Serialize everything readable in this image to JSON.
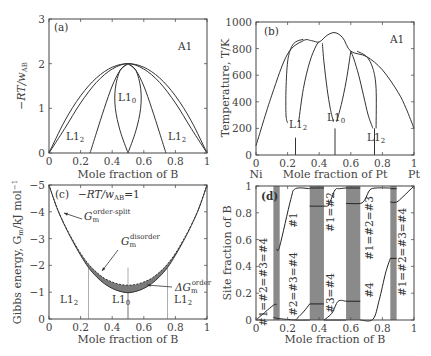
{
  "chart_data": [
    {
      "id": "a",
      "type": "line",
      "panel_label": "(a)",
      "title": "",
      "xlabel": "Mole fraction of B",
      "ylabel": "−RT/w_AB",
      "xlim": [
        0,
        1
      ],
      "ylim": [
        0,
        3
      ],
      "xticks": [
        "0",
        "0.2",
        "0.4",
        "0.6",
        "0.8",
        "1"
      ],
      "yticks": [
        "0",
        "1",
        "2",
        "3"
      ],
      "annotations": [
        "A1",
        "L1₀",
        "L1₂",
        "L1₂"
      ],
      "series": [
        {
          "name": "A1 boundary (outer)",
          "x": [
            0,
            0.1,
            0.2,
            0.3,
            0.4,
            0.5,
            0.6,
            0.7,
            0.8,
            0.9,
            1
          ],
          "y": [
            0,
            0.72,
            1.28,
            1.68,
            1.92,
            2.0,
            1.92,
            1.68,
            1.28,
            0.72,
            0
          ]
        },
        {
          "name": "A1/L1₂ boundary (inner)",
          "x": [
            0,
            0.1,
            0.2,
            0.3,
            0.4,
            0.5,
            0.6,
            0.7,
            0.8,
            0.9,
            1
          ],
          "y": [
            0,
            0.55,
            1.12,
            1.58,
            1.88,
            2.0,
            1.88,
            1.58,
            1.12,
            0.55,
            0
          ]
        },
        {
          "name": "L1₂/L1₀ boundary left",
          "x": [
            0.26,
            0.3,
            0.35,
            0.4,
            0.45,
            0.5
          ],
          "y": [
            0,
            0.45,
            1.0,
            1.5,
            1.85,
            2.0
          ]
        },
        {
          "name": "L1₂/L1₀ boundary right",
          "x": [
            0.5,
            0.55,
            0.6,
            0.65,
            0.7,
            0.74
          ],
          "y": [
            2.0,
            1.85,
            1.5,
            1.0,
            0.45,
            0
          ]
        },
        {
          "name": "L1₀ lens left",
          "x": [
            0.5,
            0.45,
            0.42,
            0.42,
            0.45,
            0.5
          ],
          "y": [
            0,
            0.5,
            1.0,
            1.45,
            1.85,
            2.0
          ]
        },
        {
          "name": "L1₀ lens right",
          "x": [
            0.5,
            0.55,
            0.58,
            0.58,
            0.55,
            0.5
          ],
          "y": [
            0,
            0.5,
            1.0,
            1.45,
            1.85,
            2.0
          ]
        }
      ]
    },
    {
      "id": "b",
      "type": "line",
      "panel_label": "(b)",
      "xlabel": "Mole fraction of Pt",
      "ylabel": "Temperature, T/K",
      "xlim": [
        0,
        1
      ],
      "ylim": [
        0,
        1000
      ],
      "xticks": [
        "0",
        "0.2",
        "0.4",
        "0.6",
        "0.8",
        "1"
      ],
      "yticks": [
        "0",
        "200",
        "400",
        "600",
        "800",
        "1000"
      ],
      "x_end_labels": [
        "Ni",
        "Pt"
      ],
      "annotations": [
        "A1",
        "L1₀",
        "L1₂",
        "L1₂"
      ],
      "series": [
        {
          "name": "A1 liquidus-like outer",
          "x": [
            0,
            0.1,
            0.2,
            0.3,
            0.35,
            0.4,
            0.45,
            0.5,
            0.55,
            0.6,
            0.7,
            0.8,
            0.9,
            0.95,
            1
          ],
          "y": [
            70,
            450,
            760,
            860,
            860,
            850,
            900,
            920,
            880,
            780,
            740,
            640,
            470,
            350,
            200
          ]
        },
        {
          "name": "L1₂ left dome left side",
          "x": [
            0.2,
            0.19,
            0.19,
            0.2,
            0.22,
            0.25,
            0.3
          ],
          "y": [
            240,
            300,
            500,
            700,
            800,
            850,
            870
          ]
        },
        {
          "name": "L1₂ left dome right side",
          "x": [
            0.27,
            0.3,
            0.34,
            0.38,
            0.4
          ],
          "y": [
            250,
            500,
            700,
            820,
            850
          ]
        },
        {
          "name": "L1₀ left side",
          "x": [
            0.42,
            0.43,
            0.45,
            0.47,
            0.49
          ],
          "y": [
            840,
            700,
            500,
            350,
            250
          ]
        },
        {
          "name": "L1₀ right side",
          "x": [
            0.51,
            0.54,
            0.57,
            0.59,
            0.6
          ],
          "y": [
            250,
            380,
            550,
            700,
            780
          ]
        },
        {
          "name": "L1₂ right dome left side",
          "x": [
            0.6,
            0.62,
            0.65,
            0.68,
            0.71,
            0.74
          ],
          "y": [
            780,
            720,
            600,
            450,
            300,
            200
          ]
        },
        {
          "name": "L1₂ right dome right side",
          "x": [
            0.64,
            0.7,
            0.74,
            0.76,
            0.76
          ],
          "y": [
            780,
            740,
            650,
            500,
            200
          ]
        },
        {
          "name": "L1₂ stem left",
          "x": [
            0.25,
            0.25
          ],
          "y": [
            0,
            130
          ]
        },
        {
          "name": "L1₀ stem",
          "x": [
            0.5,
            0.5
          ],
          "y": [
            0,
            200
          ]
        },
        {
          "name": "L1₂ stem right",
          "x": [
            0.75,
            0.75
          ],
          "y": [
            0,
            200
          ]
        }
      ]
    },
    {
      "id": "c",
      "type": "area",
      "panel_label": "(c)",
      "subtitle": "−RT/w_AB=1",
      "xlabel": "Mole fraction of B",
      "ylabel": "Gibbs energy, G_m/kJ mol⁻¹",
      "xlim": [
        0,
        1
      ],
      "ylim": [
        -5,
        0
      ],
      "xticks": [
        "0",
        "0.2",
        "0.4",
        "0.6",
        "0.8",
        "1"
      ],
      "yticks": [
        "0",
        "−1",
        "−2",
        "−3",
        "−4",
        "−5"
      ],
      "annotations": [
        "G_m^order-split",
        "G_m^disorder",
        "ΔG_m^order",
        "L1₂",
        "L1₀",
        "L1₂"
      ],
      "vertical_lines": [
        0.25,
        0.5,
        0.75
      ],
      "series": [
        {
          "name": "G_m^disorder (dashed)",
          "x": [
            0,
            0.05,
            0.1,
            0.15,
            0.2,
            0.25,
            0.3,
            0.35,
            0.4,
            0.45,
            0.5,
            0.55,
            0.6,
            0.65,
            0.7,
            0.75,
            0.8,
            0.85,
            0.9,
            0.95,
            1
          ],
          "y": [
            0,
            -0.85,
            -1.5,
            -2.05,
            -2.55,
            -2.95,
            -3.25,
            -3.48,
            -3.62,
            -3.71,
            -3.74,
            -3.71,
            -3.62,
            -3.48,
            -3.25,
            -2.95,
            -2.55,
            -2.05,
            -1.5,
            -0.85,
            0
          ]
        },
        {
          "name": "G_m^order-split (solid)",
          "x": [
            0,
            0.05,
            0.1,
            0.15,
            0.2,
            0.25,
            0.3,
            0.35,
            0.4,
            0.45,
            0.5,
            0.55,
            0.6,
            0.65,
            0.7,
            0.75,
            0.8,
            0.85,
            0.9,
            0.95,
            1
          ],
          "y": [
            0,
            -0.85,
            -1.52,
            -2.1,
            -2.62,
            -3.08,
            -3.42,
            -3.68,
            -3.86,
            -3.97,
            -4.02,
            -3.97,
            -3.86,
            -3.68,
            -3.42,
            -3.08,
            -2.62,
            -2.1,
            -1.52,
            -0.85,
            0
          ]
        }
      ]
    },
    {
      "id": "d",
      "type": "line",
      "panel_label": "(d)",
      "xlabel": "Mole fraction of B",
      "ylabel": "Site fraction of B",
      "xlim": [
        0,
        1
      ],
      "ylim": [
        0,
        1
      ],
      "xticks": [
        "0",
        "0.2",
        "0.4",
        "0.6",
        "0.8",
        "1"
      ],
      "yticks": [
        "0",
        "0.2",
        "0.4",
        "0.6",
        "0.8",
        "1"
      ],
      "shaded_bands": [
        [
          0.11,
          0.15
        ],
        [
          0.34,
          0.43
        ],
        [
          0.57,
          0.66
        ],
        [
          0.85,
          0.89
        ]
      ],
      "annotations": [
        "#1=#2=#3=#4",
        "#1",
        "#2=#3=#4",
        "#1=#2",
        "#3=#4",
        "#1=#2=#3",
        "#4",
        "#1=#2=#3=#4"
      ],
      "series": [
        {
          "name": "site #1 upper",
          "x": [
            0,
            0.11,
            0.13,
            0.13,
            0.2,
            0.25,
            0.34,
            0.43,
            0.5,
            0.57,
            0.66,
            0.73,
            0.85,
            0.89,
            1
          ],
          "y": [
            0,
            0.11,
            0.11,
            0.53,
            0.85,
            0.98,
            0.98,
            0.85,
            0.98,
            0.98,
            0.87,
            0.98,
            0.98,
            0.88,
            1
          ]
        },
        {
          "name": "site lower",
          "x": [
            0,
            0.11,
            0.13,
            0.15,
            0.25,
            0.34,
            0.43,
            0.5,
            0.57,
            0.66,
            0.73,
            0.8,
            0.85,
            0.89,
            1
          ],
          "y": [
            0,
            0.11,
            0.02,
            0.01,
            0.0,
            0.12,
            0.12,
            0.01,
            0.14,
            0.0,
            0.0,
            0.2,
            0.46,
            0.88,
            1
          ]
        }
      ]
    }
  ],
  "panels": {
    "a": {
      "label": "(a)",
      "phase_top": "A1",
      "l10": "L1",
      "l10_sub": "0",
      "l12": "L1",
      "l12_sub": "2",
      "xlabel": "Mole fraction of B",
      "ylabel_main": "−RT/w",
      "ylabel_sub": "AB"
    },
    "b": {
      "label": "(b)",
      "phase_top": "A1",
      "l10": "L1",
      "l10_sub": "0",
      "l12": "L1",
      "l12_sub": "2",
      "xlabel": "Mole fraction of Pt",
      "ylabel": "Temperature, T/K",
      "left_end": "Ni",
      "right_end": "Pt"
    },
    "c": {
      "label": "(c)",
      "cond_main": "−RT/w",
      "cond_sub": "AB",
      "cond_val": "=1",
      "g": "G",
      "m": "m",
      "order_split": "order-split",
      "disorder": "disorder",
      "delta": "ΔG",
      "order": "order",
      "l10": "L1",
      "l10_sub": "0",
      "l12": "L1",
      "l12_sub": "2",
      "xlabel": "Mole fraction of B",
      "ylabel": "Gibbs energy, G",
      "ylabel_sub": "m",
      "ylabel_unit": "/kJ mol",
      "ylabel_sup": "−1"
    },
    "d": {
      "label": "(d)",
      "xlabel": "Mole fraction of B",
      "ylabel": "Site fraction of B",
      "eq1": "#1=#2=#3=#4",
      "eq2": "#1",
      "eq3": "#2=#3=#4",
      "eq4": "#1=#2",
      "eq5": "#3=#4",
      "eq6": "#1=#2=#3",
      "eq7": "#4",
      "eq8": "#1=#2=#3=#4"
    }
  }
}
